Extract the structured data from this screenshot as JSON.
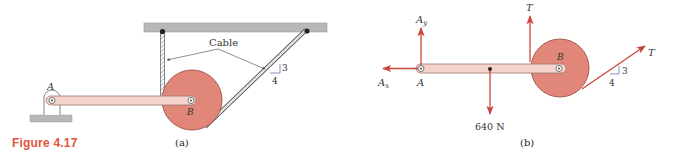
{
  "figure": {
    "label": "Figure 4.17",
    "colors": {
      "figure_label": "#e2533a",
      "disc_fill": "#e0877a",
      "disc_stroke": "#a85a50",
      "bar_fill": "#f3d2cc",
      "bar_stroke": "#a0776f",
      "force_arrow": "#c9453a",
      "support_gray": "#b8b8b8",
      "ink": "#333333",
      "slope_triangle": "#6a7fae"
    }
  },
  "panel_a": {
    "caption": "(a)",
    "cable_label": "Cable",
    "point_A": "A",
    "point_B": "B",
    "slope": {
      "rise": "3",
      "run": "4"
    }
  },
  "panel_b": {
    "caption": "(b)",
    "point_A": "A",
    "point_B": "B",
    "forces": {
      "Ax": {
        "symbol": "A",
        "subscript": "x",
        "direction": "left"
      },
      "Ay": {
        "symbol": "A",
        "subscript": "y",
        "direction": "up"
      },
      "T_vertical": {
        "symbol": "T",
        "direction": "up"
      },
      "weight": {
        "label": "640 N",
        "direction": "down"
      },
      "T_inclined": {
        "symbol": "T",
        "slope_rise": "3",
        "slope_run": "4"
      }
    }
  }
}
